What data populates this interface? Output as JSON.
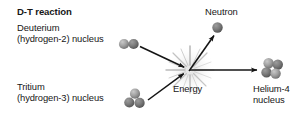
{
  "figure": {
    "title": "D-T reaction",
    "labels": {
      "deuterium": "Deuterium\n(hydrogen-2) nucleus",
      "tritium": "Tritium\n(hydrogen-3) nucleus",
      "neutron": "Neutron",
      "energy": "Energy",
      "helium": "Helium-4\nnucleus"
    },
    "colors": {
      "background": "#ffffff",
      "text": "#171717",
      "arrow": "#141414",
      "nucleon_light": "#b4b4b4",
      "nucleon_dark": "#6e6e6e",
      "burst": "#9a9a9a"
    },
    "nuclei": {
      "deuterium": {
        "nucleon_count": 2,
        "arrangement": "pair-horizontal"
      },
      "tritium": {
        "nucleon_count": 3,
        "arrangement": "triangle"
      },
      "neutron": {
        "nucleon_count": 1,
        "arrangement": "single"
      },
      "helium4": {
        "nucleon_count": 4,
        "arrangement": "diamond-cluster"
      }
    },
    "reaction": {
      "inputs": [
        "Deuterium",
        "Tritium"
      ],
      "center": "Energy",
      "outputs": [
        "Neutron",
        "Helium-4"
      ],
      "arrows": [
        {
          "from": "deuterium",
          "to": "energy"
        },
        {
          "from": "tritium",
          "to": "energy"
        },
        {
          "from": "energy",
          "to": "neutron"
        },
        {
          "from": "energy",
          "to": "helium4"
        }
      ]
    }
  }
}
